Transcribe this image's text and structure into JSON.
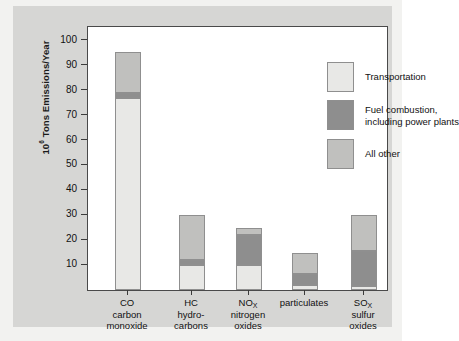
{
  "chart_data": {
    "type": "bar",
    "subtype": "stacked-bar",
    "title": "",
    "xlabel": "",
    "ylabel": "10⁶ Tons Emissions/Year",
    "ylabel_prefix": "10",
    "ylabel_exponent": "6",
    "ylabel_suffix": " Tons Emissions/Year",
    "ylim": [
      0,
      104
    ],
    "ytick_values": [
      10,
      20,
      30,
      40,
      50,
      60,
      70,
      80,
      90,
      100
    ],
    "ytick_labels": [
      "10",
      "20",
      "30",
      "40",
      "50",
      "60",
      "70",
      "80",
      "90",
      "100"
    ],
    "grid": false,
    "legend_position": "upper-right-inside",
    "categories": [
      {
        "code": "CO",
        "line1": "CO",
        "line2": "carbon",
        "line3": "monoxide",
        "subscript": ""
      },
      {
        "code": "HC",
        "line1": "HC",
        "line2": "hydro-",
        "line3": "carbons",
        "subscript": ""
      },
      {
        "code": "NOx",
        "line1": "NO",
        "line2": "nitrogen",
        "line3": "oxides",
        "subscript": "X"
      },
      {
        "code": "particulates",
        "line1": "particulates",
        "line2": "",
        "line3": "",
        "subscript": ""
      },
      {
        "code": "SOx",
        "line1": "SO",
        "line2": "sulfur",
        "line3": "oxides",
        "subscript": "X"
      }
    ],
    "series": [
      {
        "name": "Transportation",
        "color": "#e8e8e6",
        "values": [
          77,
          10,
          10,
          2,
          1.5
        ]
      },
      {
        "name": "Fuel combustion, including power plants",
        "color": "#8e8e8e",
        "values": [
          2,
          2,
          12,
          4.5,
          14
        ]
      },
      {
        "name": "All other",
        "color": "#c0c0be",
        "values": [
          16.5,
          18,
          3,
          8.5,
          14.5
        ]
      }
    ],
    "totals": [
      95.5,
      30,
      25,
      15,
      30
    ],
    "annotations": []
  },
  "legend": {
    "items": [
      {
        "label": "Transportation",
        "label_line2": "",
        "color": "#e8e8e6"
      },
      {
        "label": "Fuel combustion,",
        "label_line2": "including power plants",
        "color": "#8e8e8e"
      },
      {
        "label": "All other",
        "label_line2": "",
        "color": "#c0c0be"
      }
    ]
  },
  "colors": {
    "page_background": "#f2f2f0",
    "panel_background": "#d6d6d4",
    "plot_background": "#ffffff",
    "axis": "#3b3b3b",
    "text": "#111111",
    "bar_outline": "#8f8f8f"
  }
}
